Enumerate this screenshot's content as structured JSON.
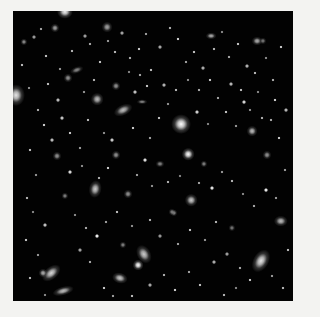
{
  "image": {
    "description": "Deep-field astronomical image of many distant galaxies on a black sky",
    "background_color": "#f3f3f1",
    "field_color": "#020202",
    "field": {
      "x": 13,
      "y": 11,
      "w": 280,
      "h": 290
    }
  },
  "galaxies": [
    {
      "x": 65,
      "y": 12,
      "w": 9,
      "h": 8,
      "rot": 0,
      "b": 0.95
    },
    {
      "x": 16,
      "y": 95,
      "w": 10,
      "h": 12,
      "rot": 0,
      "b": 0.9
    },
    {
      "x": 97,
      "y": 99,
      "w": 7,
      "h": 7,
      "rot": 0,
      "b": 0.75
    },
    {
      "x": 123,
      "y": 110,
      "w": 11,
      "h": 6,
      "rot": -25,
      "b": 0.75
    },
    {
      "x": 181,
      "y": 124,
      "w": 11,
      "h": 11,
      "rot": 0,
      "b": 1.0
    },
    {
      "x": 252,
      "y": 131,
      "w": 6,
      "h": 6,
      "rot": 0,
      "b": 0.75
    },
    {
      "x": 188,
      "y": 154,
      "w": 7,
      "h": 7,
      "rot": 0,
      "b": 1.0
    },
    {
      "x": 95,
      "y": 189,
      "w": 7,
      "h": 10,
      "rot": 10,
      "b": 0.8
    },
    {
      "x": 191,
      "y": 200,
      "w": 7,
      "h": 7,
      "rot": 0,
      "b": 0.8
    },
    {
      "x": 281,
      "y": 221,
      "w": 8,
      "h": 6,
      "rot": 0,
      "b": 0.75
    },
    {
      "x": 144,
      "y": 254,
      "w": 8,
      "h": 11,
      "rot": -30,
      "b": 0.8
    },
    {
      "x": 138,
      "y": 265,
      "w": 6,
      "h": 6,
      "rot": 0,
      "b": 1.0
    },
    {
      "x": 51,
      "y": 273,
      "w": 12,
      "h": 7,
      "rot": -40,
      "b": 0.85
    },
    {
      "x": 43,
      "y": 273,
      "w": 5,
      "h": 5,
      "rot": 0,
      "b": 0.7
    },
    {
      "x": 261,
      "y": 261,
      "w": 9,
      "h": 14,
      "rot": 30,
      "b": 0.9
    },
    {
      "x": 120,
      "y": 278,
      "w": 9,
      "h": 6,
      "rot": 15,
      "b": 0.8
    },
    {
      "x": 63,
      "y": 291,
      "w": 12,
      "h": 5,
      "rot": -15,
      "b": 0.75
    },
    {
      "x": 211,
      "y": 36,
      "w": 6,
      "h": 4,
      "rot": 0,
      "b": 0.7
    },
    {
      "x": 257,
      "y": 41,
      "w": 6,
      "h": 5,
      "rot": 0,
      "b": 0.7
    },
    {
      "x": 107,
      "y": 27,
      "w": 6,
      "h": 6,
      "rot": 0,
      "b": 0.65
    },
    {
      "x": 55,
      "y": 28,
      "w": 5,
      "h": 5,
      "rot": 0,
      "b": 0.65
    },
    {
      "x": 24,
      "y": 42,
      "w": 4,
      "h": 4,
      "rot": 0,
      "b": 0.6
    },
    {
      "x": 68,
      "y": 78,
      "w": 5,
      "h": 5,
      "rot": 0,
      "b": 0.6
    },
    {
      "x": 116,
      "y": 86,
      "w": 5,
      "h": 5,
      "rot": 0,
      "b": 0.6
    },
    {
      "x": 77,
      "y": 70,
      "w": 8,
      "h": 4,
      "rot": -20,
      "b": 0.55
    },
    {
      "x": 142,
      "y": 102,
      "w": 6,
      "h": 3,
      "rot": 0,
      "b": 0.55
    },
    {
      "x": 116,
      "y": 155,
      "w": 5,
      "h": 5,
      "rot": 0,
      "b": 0.6
    },
    {
      "x": 128,
      "y": 194,
      "w": 5,
      "h": 5,
      "rot": 0,
      "b": 0.6
    },
    {
      "x": 174,
      "y": 213,
      "w": 4,
      "h": 4,
      "rot": 0,
      "b": 0.6
    },
    {
      "x": 267,
      "y": 155,
      "w": 5,
      "h": 5,
      "rot": 0,
      "b": 0.6
    },
    {
      "x": 57,
      "y": 156,
      "w": 5,
      "h": 5,
      "rot": 0,
      "b": 0.6
    },
    {
      "x": 65,
      "y": 196,
      "w": 4,
      "h": 4,
      "rot": 0,
      "b": 0.55
    },
    {
      "x": 123,
      "y": 245,
      "w": 4,
      "h": 4,
      "rot": 0,
      "b": 0.55
    },
    {
      "x": 160,
      "y": 164,
      "w": 5,
      "h": 4,
      "rot": 0,
      "b": 0.55
    },
    {
      "x": 204,
      "y": 164,
      "w": 4,
      "h": 4,
      "rot": 0,
      "b": 0.55
    },
    {
      "x": 263,
      "y": 41,
      "w": 4,
      "h": 4,
      "rot": 0,
      "b": 0.5
    },
    {
      "x": 232,
      "y": 228,
      "w": 4,
      "h": 4,
      "rot": 0,
      "b": 0.5
    },
    {
      "x": 172,
      "y": 212,
      "w": 4,
      "h": 4,
      "rot": 0,
      "b": 0.5
    }
  ],
  "stars": [
    [
      34,
      37
    ],
    [
      41,
      29
    ],
    [
      46,
      56
    ],
    [
      60,
      69
    ],
    [
      72,
      51
    ],
    [
      85,
      36
    ],
    [
      90,
      44
    ],
    [
      100,
      62
    ],
    [
      108,
      41
    ],
    [
      115,
      52
    ],
    [
      122,
      33
    ],
    [
      130,
      58
    ],
    [
      139,
      49
    ],
    [
      146,
      34
    ],
    [
      151,
      70
    ],
    [
      160,
      47
    ],
    [
      170,
      28
    ],
    [
      178,
      39
    ],
    [
      186,
      62
    ],
    [
      194,
      52
    ],
    [
      203,
      68
    ],
    [
      214,
      49
    ],
    [
      222,
      32
    ],
    [
      229,
      57
    ],
    [
      238,
      44
    ],
    [
      247,
      66
    ],
    [
      255,
      73
    ],
    [
      266,
      58
    ],
    [
      273,
      80
    ],
    [
      281,
      47
    ],
    [
      286,
      110
    ],
    [
      22,
      65
    ],
    [
      29,
      88
    ],
    [
      38,
      110
    ],
    [
      44,
      125
    ],
    [
      52,
      140
    ],
    [
      30,
      150
    ],
    [
      36,
      175
    ],
    [
      27,
      198
    ],
    [
      33,
      212
    ],
    [
      45,
      225
    ],
    [
      26,
      240
    ],
    [
      38,
      255
    ],
    [
      30,
      278
    ],
    [
      45,
      295
    ],
    [
      62,
      118
    ],
    [
      70,
      133
    ],
    [
      80,
      148
    ],
    [
      88,
      120
    ],
    [
      104,
      133
    ],
    [
      112,
      140
    ],
    [
      133,
      128
    ],
    [
      150,
      138
    ],
    [
      159,
      118
    ],
    [
      168,
      104
    ],
    [
      197,
      112
    ],
    [
      208,
      124
    ],
    [
      218,
      98
    ],
    [
      226,
      112
    ],
    [
      236,
      126
    ],
    [
      244,
      102
    ],
    [
      258,
      92
    ],
    [
      271,
      120
    ],
    [
      279,
      138
    ],
    [
      285,
      170
    ],
    [
      70,
      172
    ],
    [
      82,
      166
    ],
    [
      99,
      178
    ],
    [
      108,
      168
    ],
    [
      137,
      175
    ],
    [
      145,
      160
    ],
    [
      152,
      186
    ],
    [
      168,
      182
    ],
    [
      180,
      176
    ],
    [
      199,
      183
    ],
    [
      212,
      188
    ],
    [
      222,
      172
    ],
    [
      232,
      181
    ],
    [
      243,
      194
    ],
    [
      254,
      206
    ],
    [
      266,
      190
    ],
    [
      276,
      198
    ],
    [
      288,
      250
    ],
    [
      75,
      215
    ],
    [
      86,
      228
    ],
    [
      97,
      236
    ],
    [
      106,
      222
    ],
    [
      117,
      212
    ],
    [
      132,
      226
    ],
    [
      150,
      220
    ],
    [
      160,
      236
    ],
    [
      178,
      244
    ],
    [
      190,
      230
    ],
    [
      205,
      240
    ],
    [
      216,
      222
    ],
    [
      227,
      254
    ],
    [
      240,
      268
    ],
    [
      250,
      280
    ],
    [
      272,
      276
    ],
    [
      283,
      288
    ],
    [
      80,
      250
    ],
    [
      90,
      262
    ],
    [
      104,
      288
    ],
    [
      113,
      296
    ],
    [
      132,
      296
    ],
    [
      150,
      285
    ],
    [
      164,
      275
    ],
    [
      175,
      290
    ],
    [
      189,
      272
    ],
    [
      200,
      285
    ],
    [
      214,
      262
    ],
    [
      224,
      295
    ],
    [
      236,
      288
    ],
    [
      140,
      75
    ],
    [
      147,
      86
    ],
    [
      164,
      85
    ],
    [
      176,
      90
    ],
    [
      188,
      80
    ],
    [
      199,
      90
    ],
    [
      210,
      80
    ],
    [
      231,
      84
    ],
    [
      241,
      90
    ],
    [
      250,
      110
    ],
    [
      262,
      118
    ],
    [
      275,
      100
    ],
    [
      58,
      100
    ],
    [
      48,
      84
    ],
    [
      84,
      92
    ],
    [
      94,
      80
    ],
    [
      129,
      72
    ],
    [
      135,
      92
    ]
  ]
}
